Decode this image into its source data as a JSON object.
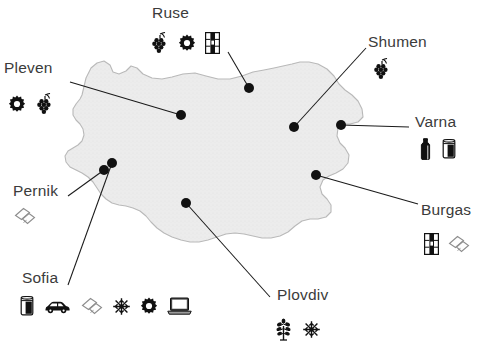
{
  "map": {
    "name": "bulgaria-outline",
    "fill": "#ececec",
    "stroke": "#b9b9b9",
    "background": "#ffffff"
  },
  "style": {
    "label_color": "#3b3b3b",
    "leader_line_color": "#1a1a1a",
    "dot_color": "#111111"
  },
  "cities": [
    {
      "id": "ruse",
      "label": "Ruse",
      "label_x": 152,
      "label_y": 5,
      "dot_x": 249,
      "dot_y": 88,
      "line": [
        [
          228,
          52
        ],
        [
          249,
          88
        ]
      ],
      "icons_x": 150,
      "icons_y": 32,
      "icons": [
        "grapes-icon",
        "gear-icon",
        "book-icon"
      ]
    },
    {
      "id": "pleven",
      "label": "Pleven",
      "label_x": 4,
      "label_y": 60,
      "dot_x": 181,
      "dot_y": 115,
      "line": [
        [
          70,
          82
        ],
        [
          181,
          115
        ]
      ],
      "icons_x": 8,
      "icons_y": 93,
      "icons": [
        "gear-icon",
        "grapes-icon"
      ]
    },
    {
      "id": "shumen",
      "label": "Shumen",
      "label_x": 368,
      "label_y": 34,
      "dot_x": 294,
      "dot_y": 127,
      "line": [
        [
          366,
          48
        ],
        [
          294,
          127
        ]
      ],
      "icons_x": 372,
      "icons_y": 58,
      "icons": [
        "grapes-icon"
      ]
    },
    {
      "id": "varna",
      "label": "Varna",
      "label_x": 415,
      "label_y": 114,
      "dot_x": 341,
      "dot_y": 125,
      "line": [
        [
          409,
          127
        ],
        [
          341,
          125
        ]
      ],
      "icons_x": 418,
      "icons_y": 138,
      "icons": [
        "bottle-icon",
        "can-icon"
      ]
    },
    {
      "id": "burgas",
      "label": "Burgas",
      "label_x": 421,
      "label_y": 202,
      "dot_x": 316,
      "dot_y": 175,
      "line": [
        [
          418,
          204
        ],
        [
          316,
          175
        ]
      ],
      "icons_x": 424,
      "icons_y": 233,
      "icons": [
        "book-icon",
        "papers-icon"
      ]
    },
    {
      "id": "pernik",
      "label": "Pernik",
      "label_x": 13,
      "label_y": 183,
      "dot_x": 104,
      "dot_y": 170,
      "line": [
        [
          68,
          196
        ],
        [
          104,
          170
        ]
      ],
      "icons_x": 14,
      "icons_y": 207,
      "icons": [
        "papers-icon"
      ]
    },
    {
      "id": "sofia",
      "label": "Sofia",
      "label_x": 22,
      "label_y": 270,
      "dot_x": 112,
      "dot_y": 163,
      "line": [
        [
          68,
          285
        ],
        [
          112,
          163
        ]
      ],
      "icons_x": 20,
      "icons_y": 296,
      "icons": [
        "can-icon",
        "car-icon",
        "papers-icon",
        "flower-icon",
        "gear-icon",
        "laptop-icon"
      ]
    },
    {
      "id": "plovdiv",
      "label": "Plovdiv",
      "label_x": 277,
      "label_y": 287,
      "dot_x": 186,
      "dot_y": 203,
      "line": [
        [
          270,
          297
        ],
        [
          186,
          203
        ]
      ],
      "icons_x": 274,
      "icons_y": 318,
      "icons": [
        "plant-icon",
        "flower-icon"
      ]
    }
  ]
}
